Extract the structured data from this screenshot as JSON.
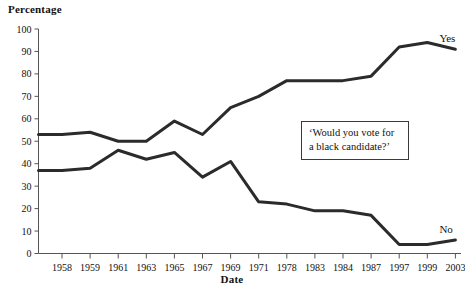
{
  "figure": {
    "background_color": "#ffffff",
    "line_color": "#2b2b2b",
    "axis_color": "#555555",
    "text_color": "#111111"
  },
  "labels": {
    "y_axis_title": "Percentage",
    "x_axis_title": "Date",
    "series_yes": "Yes",
    "series_no": "No"
  },
  "callout": {
    "text": "‘Would you vote for\na black candidate?’"
  },
  "chart_data": {
    "type": "line",
    "title": "",
    "subtitle": "",
    "xlabel": "Date",
    "ylabel": "Percentage",
    "annotations": [
      "‘Would you vote for a black candidate?’"
    ],
    "legend": [
      "Yes",
      "No"
    ],
    "legend_position": "inline-right-of-line-ends",
    "grid": false,
    "ylim": [
      0,
      100
    ],
    "yticks": [
      0,
      10,
      20,
      30,
      40,
      50,
      60,
      70,
      80,
      90,
      100
    ],
    "ytick_labels": [
      "0",
      "10",
      "20",
      "30",
      "40",
      "50",
      "60",
      "70",
      "80",
      "90",
      "100"
    ],
    "categories": [
      "1958",
      "1959",
      "1961",
      "1963",
      "1965",
      "1967",
      "1969",
      "1971",
      "1978",
      "1983",
      "1984",
      "1987",
      "1997",
      "1999",
      "2003"
    ],
    "series": [
      {
        "name": "Yes",
        "values": [
          53,
          54,
          50,
          50,
          59,
          53,
          65,
          70,
          77,
          77,
          77,
          79,
          92,
          94,
          91
        ]
      },
      {
        "name": "No",
        "values": [
          37,
          38,
          46,
          42,
          45,
          34,
          41,
          23,
          22,
          19,
          19,
          17,
          4,
          4,
          6
        ]
      }
    ],
    "series_start_edge": {
      "note": "Both lines begin at the y-axis, one half-step left of the first category.",
      "Yes": 53,
      "No": 37
    }
  }
}
